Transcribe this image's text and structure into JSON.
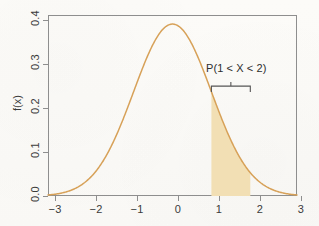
{
  "chart_data": {
    "type": "line",
    "title": "",
    "subtitle": "",
    "xlabel": "",
    "ylabel": "f(x)",
    "xlim": [
      -3.2,
      3.2
    ],
    "ylim": [
      0.0,
      0.42
    ],
    "grid": false,
    "legend": "none",
    "distribution": "standard normal density",
    "x_ticks": [
      "−3",
      "−2",
      "−1",
      "0",
      "1",
      "2",
      "3"
    ],
    "x_tick_values": [
      -3,
      -2,
      -1,
      0,
      1,
      2,
      3
    ],
    "y_ticks": [
      "0.0",
      "0.1",
      "0.2",
      "0.3",
      "0.4"
    ],
    "y_tick_values": [
      0.0,
      0.1,
      0.2,
      0.3,
      0.4
    ],
    "series": [
      {
        "name": "standard normal pdf",
        "color": "#d7a158",
        "x": [
          -3.2,
          -3.0,
          -2.8,
          -2.6,
          -2.4,
          -2.2,
          -2.0,
          -1.8,
          -1.6,
          -1.4,
          -1.2,
          -1.0,
          -0.8,
          -0.6,
          -0.4,
          -0.2,
          0.0,
          0.2,
          0.4,
          0.6,
          0.8,
          1.0,
          1.2,
          1.4,
          1.6,
          1.8,
          2.0,
          2.2,
          2.4,
          2.6,
          2.8,
          3.0,
          3.2
        ],
        "values": [
          0.0024,
          0.0044,
          0.0079,
          0.0136,
          0.0224,
          0.0355,
          0.054,
          0.079,
          0.1109,
          0.1497,
          0.1942,
          0.242,
          0.2897,
          0.3332,
          0.3683,
          0.391,
          0.3989,
          0.391,
          0.3683,
          0.3332,
          0.2897,
          0.242,
          0.1942,
          0.1497,
          0.1109,
          0.079,
          0.054,
          0.0355,
          0.0224,
          0.0136,
          0.0079,
          0.0044,
          0.0024
        ]
      }
    ],
    "shaded_region": {
      "label": "P(1 < X < 2)",
      "x_from": 1,
      "x_to": 2,
      "fill_color": "#f2dfb4",
      "probability_description": "area under the standard normal curve between x = 1 and x = 2"
    },
    "annotations": [
      {
        "text": "P(1 < X < 2)",
        "x": 1.5,
        "y": 0.255,
        "bracket_from": 1,
        "bracket_to": 2
      }
    ]
  },
  "axes": {
    "y_title": "f(x)",
    "x_tick_labels": [
      "−3",
      "−2",
      "−1",
      "0",
      "1",
      "2",
      "3"
    ],
    "y_tick_labels": [
      "0.0",
      "0.1",
      "0.2",
      "0.3",
      "0.4"
    ]
  },
  "annotation": {
    "label": "P(1 < X < 2)"
  },
  "colors": {
    "curve": "#d7a158",
    "fill": "#f2dfb4",
    "frame": "#8e8e8e",
    "text": "#3b3b3b",
    "background": "#fbfaf7"
  }
}
